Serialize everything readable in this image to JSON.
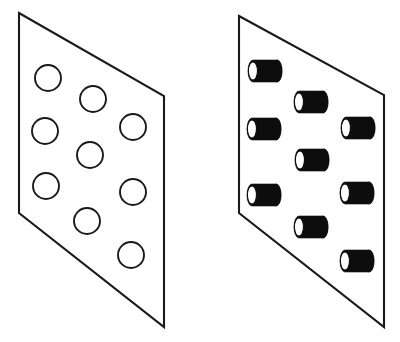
{
  "figure": {
    "background_color": "#ffffff",
    "line_color": "#1a1a1a",
    "fill_color": "#0d0d0d",
    "width": 400,
    "height": 342
  },
  "panels": [
    {
      "id": "left-panel",
      "name": "panel-with-holes",
      "label": "Panel with nine circular holes",
      "outline_points": "19,13 164,96 164,327 19,213",
      "feature_type": "circle",
      "feature_count": 9,
      "features": [
        {
          "id": "hole-1",
          "cx": 48,
          "cy": 78,
          "r": 13
        },
        {
          "id": "hole-2",
          "cx": 93,
          "cy": 99,
          "r": 13
        },
        {
          "id": "hole-3",
          "cx": 133,
          "cy": 127,
          "r": 13
        },
        {
          "id": "hole-4",
          "cx": 45,
          "cy": 131,
          "r": 13
        },
        {
          "id": "hole-5",
          "cx": 90,
          "cy": 155,
          "r": 13
        },
        {
          "id": "hole-6",
          "cx": 133,
          "cy": 192,
          "r": 13
        },
        {
          "id": "hole-7",
          "cx": 46,
          "cy": 186,
          "r": 13
        },
        {
          "id": "hole-8",
          "cx": 87,
          "cy": 221,
          "r": 13
        },
        {
          "id": "hole-9",
          "cx": 131,
          "cy": 255,
          "r": 13
        }
      ]
    },
    {
      "id": "right-panel",
      "name": "panel-with-cylinders",
      "label": "Panel with nine protruding cylinders",
      "outline_points": "239,16 384,95 384,327 239,213",
      "feature_type": "cylinder",
      "feature_count": 9,
      "features": [
        {
          "id": "cylinder-1",
          "x": 248,
          "y": 60,
          "w": 34,
          "h": 22
        },
        {
          "id": "cylinder-2",
          "x": 294,
          "y": 91,
          "w": 34,
          "h": 22
        },
        {
          "id": "cylinder-3",
          "x": 341,
          "y": 117,
          "w": 34,
          "h": 22
        },
        {
          "id": "cylinder-4",
          "x": 247,
          "y": 118,
          "w": 34,
          "h": 22
        },
        {
          "id": "cylinder-5",
          "x": 295,
          "y": 149,
          "w": 34,
          "h": 22
        },
        {
          "id": "cylinder-6",
          "x": 340,
          "y": 182,
          "w": 34,
          "h": 22
        },
        {
          "id": "cylinder-7",
          "x": 247,
          "y": 184,
          "w": 34,
          "h": 22
        },
        {
          "id": "cylinder-8",
          "x": 294,
          "y": 216,
          "w": 34,
          "h": 22
        },
        {
          "id": "cylinder-9",
          "x": 340,
          "y": 250,
          "w": 34,
          "h": 22
        }
      ]
    }
  ]
}
